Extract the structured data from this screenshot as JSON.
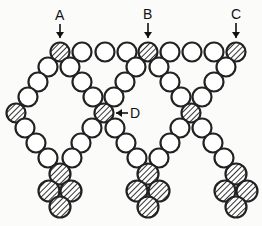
{
  "diagram": {
    "bead_radius": 9.5,
    "colors": {
      "stroke": "#222222",
      "open_fill": "#ffffff",
      "hatch": "#333333",
      "background": "#fbfbf9"
    },
    "labels": [
      {
        "id": "A",
        "text": "A",
        "x": 55,
        "y": 20,
        "arrow": {
          "x1": 60,
          "y1": 24,
          "x2": 60,
          "y2": 38
        }
      },
      {
        "id": "B",
        "text": "B",
        "x": 143,
        "y": 19,
        "arrow": {
          "x1": 148,
          "y1": 23,
          "x2": 148,
          "y2": 38
        }
      },
      {
        "id": "C",
        "text": "C",
        "x": 231,
        "y": 19,
        "arrow": {
          "x1": 236,
          "y1": 23,
          "x2": 236,
          "y2": 38
        }
      },
      {
        "id": "D",
        "text": "D",
        "x": 130,
        "y": 118,
        "arrow": {
          "x1": 128,
          "y1": 113,
          "x2": 116,
          "y2": 113
        }
      }
    ],
    "beads": [
      {
        "x": 60,
        "y": 52,
        "hatched": true
      },
      {
        "x": 82,
        "y": 52,
        "hatched": false
      },
      {
        "x": 105,
        "y": 52,
        "hatched": false
      },
      {
        "x": 127,
        "y": 52,
        "hatched": false
      },
      {
        "x": 148,
        "y": 52,
        "hatched": true
      },
      {
        "x": 170,
        "y": 52,
        "hatched": false
      },
      {
        "x": 192,
        "y": 52,
        "hatched": false
      },
      {
        "x": 214,
        "y": 52,
        "hatched": false
      },
      {
        "x": 236,
        "y": 52,
        "hatched": true
      },
      {
        "x": 48,
        "y": 67,
        "hatched": false
      },
      {
        "x": 38,
        "y": 82,
        "hatched": false
      },
      {
        "x": 28,
        "y": 97,
        "hatched": false
      },
      {
        "x": 16,
        "y": 113,
        "hatched": true
      },
      {
        "x": 25,
        "y": 128,
        "hatched": false
      },
      {
        "x": 36,
        "y": 143,
        "hatched": false
      },
      {
        "x": 48,
        "y": 158,
        "hatched": false
      },
      {
        "x": 70,
        "y": 67,
        "hatched": false
      },
      {
        "x": 82,
        "y": 82,
        "hatched": false
      },
      {
        "x": 93,
        "y": 97,
        "hatched": false
      },
      {
        "x": 104,
        "y": 113,
        "hatched": true
      },
      {
        "x": 92,
        "y": 128,
        "hatched": false
      },
      {
        "x": 81,
        "y": 143,
        "hatched": false
      },
      {
        "x": 72,
        "y": 158,
        "hatched": false
      },
      {
        "x": 136,
        "y": 67,
        "hatched": false
      },
      {
        "x": 125,
        "y": 82,
        "hatched": false
      },
      {
        "x": 114,
        "y": 97,
        "hatched": false
      },
      {
        "x": 115,
        "y": 128,
        "hatched": false
      },
      {
        "x": 126,
        "y": 143,
        "hatched": false
      },
      {
        "x": 137,
        "y": 158,
        "hatched": false
      },
      {
        "x": 159,
        "y": 67,
        "hatched": false
      },
      {
        "x": 170,
        "y": 82,
        "hatched": false
      },
      {
        "x": 181,
        "y": 97,
        "hatched": false
      },
      {
        "x": 191,
        "y": 113,
        "hatched": true
      },
      {
        "x": 180,
        "y": 128,
        "hatched": false
      },
      {
        "x": 170,
        "y": 143,
        "hatched": false
      },
      {
        "x": 159,
        "y": 158,
        "hatched": false
      },
      {
        "x": 226,
        "y": 67,
        "hatched": false
      },
      {
        "x": 214,
        "y": 82,
        "hatched": false
      },
      {
        "x": 202,
        "y": 97,
        "hatched": false
      },
      {
        "x": 202,
        "y": 128,
        "hatched": false
      },
      {
        "x": 213,
        "y": 143,
        "hatched": false
      },
      {
        "x": 224,
        "y": 158,
        "hatched": false
      }
    ],
    "clusters": [
      {
        "beads": [
          {
            "x": 60,
            "y": 174
          },
          {
            "x": 49,
            "y": 191
          },
          {
            "x": 71,
            "y": 191
          },
          {
            "x": 60,
            "y": 207
          }
        ]
      },
      {
        "beads": [
          {
            "x": 148,
            "y": 174
          },
          {
            "x": 137,
            "y": 191
          },
          {
            "x": 159,
            "y": 191
          },
          {
            "x": 148,
            "y": 207
          }
        ]
      },
      {
        "beads": [
          {
            "x": 236,
            "y": 174
          },
          {
            "x": 225,
            "y": 191
          },
          {
            "x": 247,
            "y": 191
          },
          {
            "x": 236,
            "y": 207
          }
        ]
      }
    ]
  }
}
